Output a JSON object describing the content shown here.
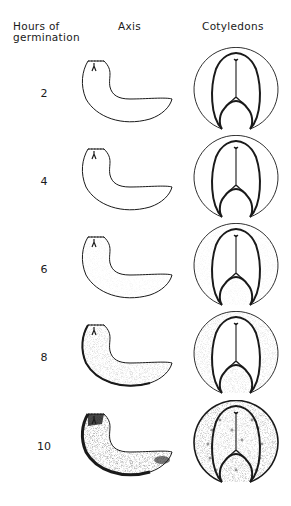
{
  "headers": {
    "hours_line1": "Hours of",
    "hours_line2": "germination",
    "axis": "Axis",
    "cotyledons": "Cotyledons"
  },
  "rows": [
    {
      "hours": "2",
      "stain": 0
    },
    {
      "hours": "4",
      "stain": 0
    },
    {
      "hours": "6",
      "stain": 1
    },
    {
      "hours": "8",
      "stain": 2
    },
    {
      "hours": "10",
      "stain": 3
    }
  ],
  "colors": {
    "ink": "#1a1a1a",
    "background": "#ffffff"
  }
}
